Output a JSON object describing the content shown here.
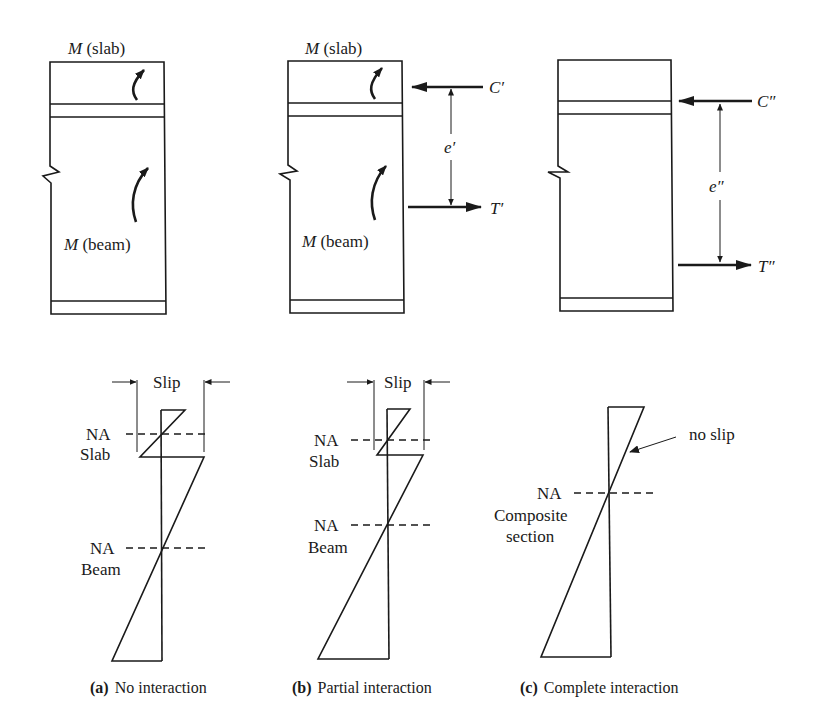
{
  "panels": {
    "a": {
      "section": {
        "slab_moment_symbol": "M",
        "slab_moment_label": " (slab)",
        "beam_moment_symbol": "M",
        "beam_moment_label": " (beam)"
      },
      "strain": {
        "slip_label": "Slip",
        "na_slab_line1": "NA",
        "na_slab_line2": "Slab",
        "na_beam_line1": "NA",
        "na_beam_line2": "Beam"
      },
      "caption_letter": "(a)",
      "caption_text": "No interaction"
    },
    "b": {
      "section": {
        "slab_moment_symbol": "M",
        "slab_moment_label": " (slab)",
        "beam_moment_symbol": "M",
        "beam_moment_label": " (beam)",
        "compression_label": "C′",
        "tension_label": "T′",
        "lever_arm_label": "e′"
      },
      "strain": {
        "slip_label": "Slip",
        "na_slab_line1": "NA",
        "na_slab_line2": "Slab",
        "na_beam_line1": "NA",
        "na_beam_line2": "Beam"
      },
      "caption_letter": "(b)",
      "caption_text": "Partial interaction"
    },
    "c": {
      "section": {
        "compression_label": "C″",
        "tension_label": "T″",
        "lever_arm_label": "e″"
      },
      "strain": {
        "no_slip_label": "no slip",
        "na_line1": "NA",
        "na_line2": "Composite",
        "na_line3": "section"
      },
      "caption_letter": "(c)",
      "caption_text": "Complete interaction"
    }
  },
  "colors": {
    "ink": "#1a1a1a",
    "background": "#ffffff"
  }
}
